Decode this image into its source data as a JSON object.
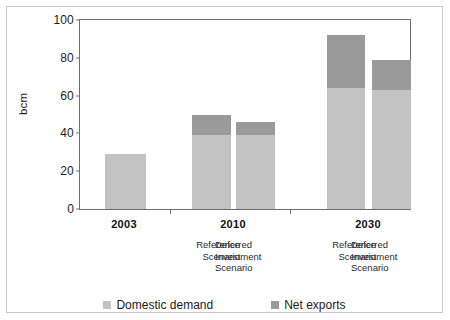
{
  "chart_data": {
    "type": "bar",
    "stacked": true,
    "title": "",
    "xlabel": "",
    "ylabel": "bcm",
    "ylim": [
      0,
      100
    ],
    "yticks": [
      0,
      20,
      40,
      60,
      80,
      100
    ],
    "ytick_labels": [
      "0",
      "20",
      "40",
      "60",
      "80",
      "100"
    ],
    "grid": false,
    "legend_position": "bottom-center",
    "categories": [
      "2003",
      "2010 Reference Scenario",
      "2010 Deferred Investment Scenario",
      "2030 Reference Scenario",
      "2030 Deferred Investment Scenario"
    ],
    "series": [
      {
        "name": "Domestic demand",
        "color": "#c3c3c3",
        "values": [
          29,
          39,
          39,
          64,
          63
        ]
      },
      {
        "name": "Net exports",
        "color": "#9a9a9a",
        "values": [
          0,
          11,
          7,
          28,
          16
        ]
      }
    ],
    "totals": [
      29,
      50,
      46,
      92,
      79
    ]
  },
  "axis": {
    "y_label": "bcm",
    "y_ticks": [
      {
        "label": "100",
        "value": 100
      },
      {
        "label": "80",
        "value": 80
      },
      {
        "label": "60",
        "value": 60
      },
      {
        "label": "40",
        "value": 40
      },
      {
        "label": "20",
        "value": 20
      },
      {
        "label": "0",
        "value": 0
      }
    ]
  },
  "x_axis": {
    "groups": [
      {
        "year": "2003"
      },
      {
        "year": "2010"
      },
      {
        "year": "2030"
      }
    ],
    "scenarios": {
      "reference": "Reference\nScenario",
      "reference_line1": "Reference",
      "reference_line2": "Scenario",
      "deferred_line1": "Deferred",
      "deferred_line2": "Investment",
      "deferred_line3": "Scenario"
    }
  },
  "legend": {
    "items": [
      {
        "label": "Domestic demand",
        "color": "#c3c3c3"
      },
      {
        "label": "Net exports",
        "color": "#9a9a9a"
      }
    ]
  }
}
